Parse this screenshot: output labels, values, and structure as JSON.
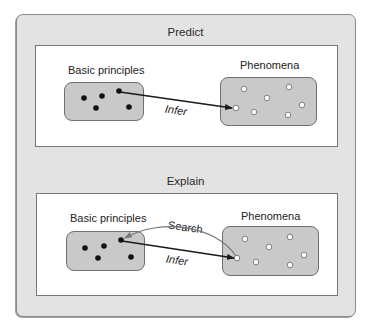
{
  "panels": [
    {
      "title": "Predict",
      "left_label": "Basic principles",
      "right_label": "Phenomena",
      "arrows": [
        {
          "label": "Infer",
          "from": "principle",
          "to": "phenomenon"
        }
      ]
    },
    {
      "title": "Explain",
      "left_label": "Basic principles",
      "right_label": "Phenomena",
      "arrows": [
        {
          "label": "Search",
          "from": "phenomenon",
          "to": "principle"
        },
        {
          "label": "Infer",
          "from": "principle",
          "to": "phenomenon"
        }
      ]
    }
  ],
  "colors": {
    "outer_fill": "#e3e3e3",
    "box_fill": "#c9c9c9",
    "principle_dot": "#111111",
    "phenomenon_dot": "#ffffff",
    "infer_arrow": "#1a1a1a",
    "search_arrow": "#777777"
  }
}
